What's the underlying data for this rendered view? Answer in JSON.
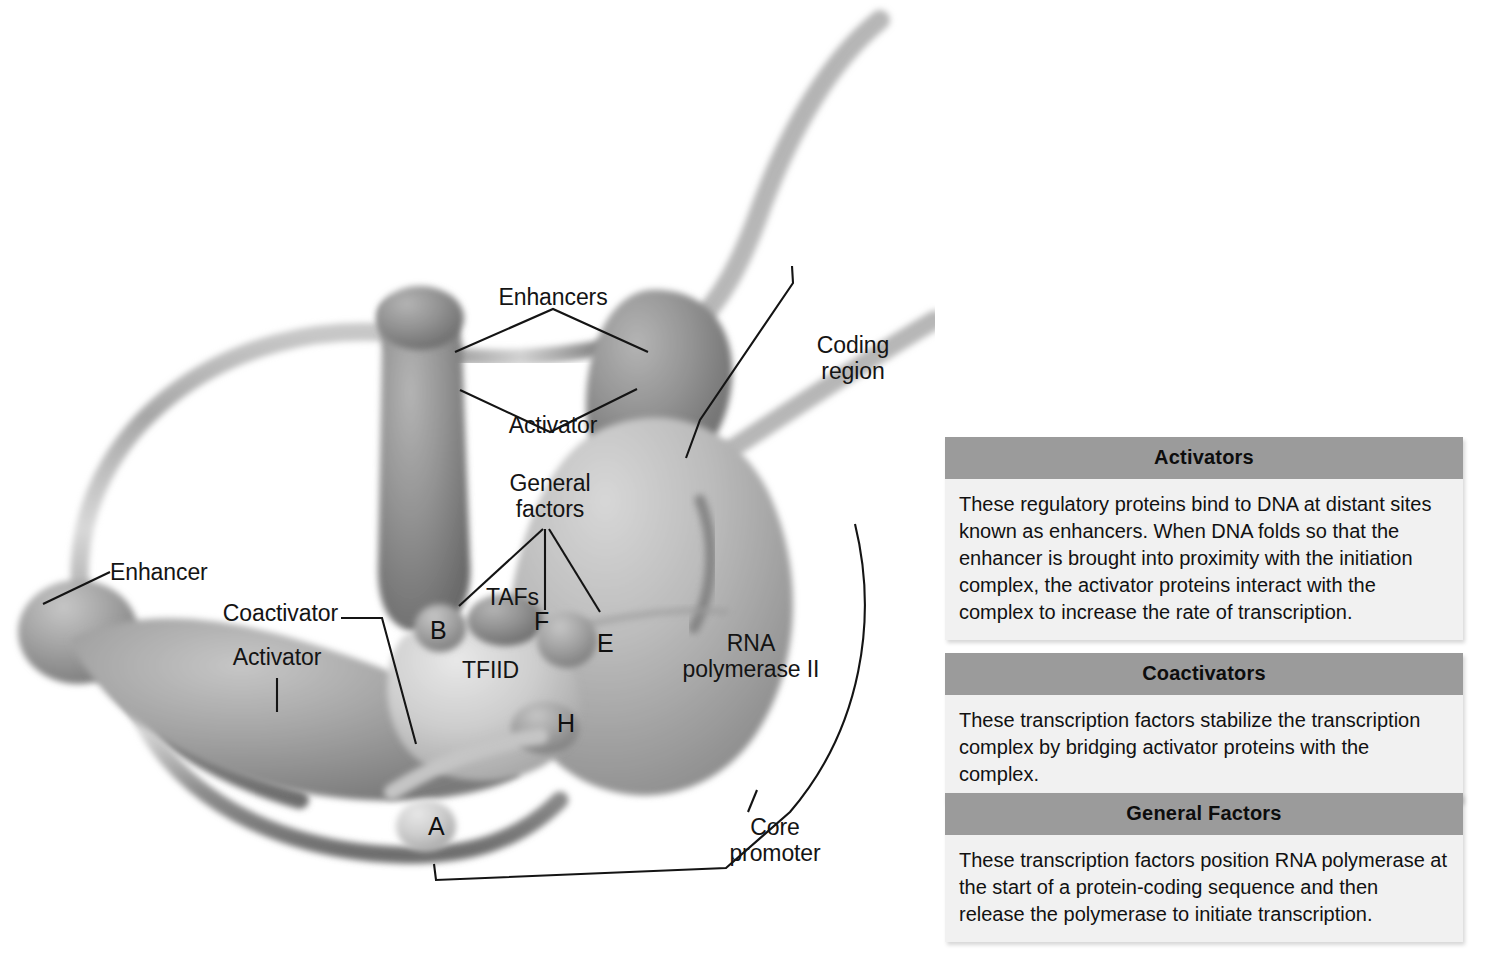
{
  "figure": {
    "background_color": "#ffffff"
  },
  "diagram": {
    "labels": [
      {
        "name": "enhancers",
        "text": "Enhancers"
      },
      {
        "name": "activator-top",
        "text": "Activator"
      },
      {
        "name": "general-factors",
        "text": "General\nfactors"
      },
      {
        "name": "coding-region",
        "text": "Coding\nregion"
      },
      {
        "name": "enhancer-left",
        "text": "Enhancer"
      },
      {
        "name": "coactivator",
        "text": "Coactivator"
      },
      {
        "name": "activator-left",
        "text": "Activator"
      },
      {
        "name": "tafs",
        "text": "TAFs"
      },
      {
        "name": "tfiid",
        "text": "TFIID"
      },
      {
        "name": "rna-polymerase",
        "text": "RNA\npolymerase II"
      },
      {
        "name": "core-promoter",
        "text": "Core\npromoter"
      }
    ],
    "subunit_letters": [
      {
        "name": "subunit-b",
        "text": "B"
      },
      {
        "name": "subunit-f",
        "text": "F"
      },
      {
        "name": "subunit-e",
        "text": "E"
      },
      {
        "name": "subunit-h",
        "text": "H"
      },
      {
        "name": "subunit-a",
        "text": "A"
      }
    ],
    "colors": {
      "dna_strand": "#8e8e8e",
      "activator_protein": "#8a8a8a",
      "polymerase": "#b6b6b6",
      "tfiid": "#c9c9c9",
      "leader_line": "#141414"
    }
  },
  "panels": [
    {
      "name": "activators",
      "title": "Activators",
      "body": "These regulatory proteins bind to DNA at distant sites known as enhancers. When DNA folds so that the enhancer is brought into proximity with the initiation complex, the activator proteins interact with the complex to increase the rate of transcription."
    },
    {
      "name": "coactivators",
      "title": "Coactivators",
      "body": "These transcription factors stabilize the transcription complex by bridging activator proteins with the complex."
    },
    {
      "name": "general-factors",
      "title": "General Factors",
      "body": "These transcription factors position RNA polymerase at the start of a protein-coding sequence and then release the polymerase to initiate transcription."
    }
  ]
}
